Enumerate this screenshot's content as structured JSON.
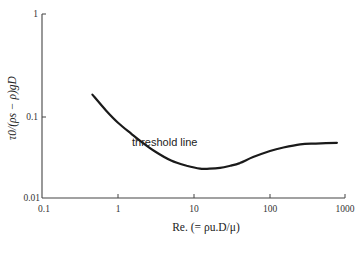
{
  "chart_data": {
    "type": "line",
    "title": "",
    "xlabel": "Re. (= ρu.D/μ)",
    "ylabel": "τ0/(ρs − ρ)gD",
    "xscale": "log",
    "yscale": "log",
    "xlim": [
      0.1,
      1000
    ],
    "ylim": [
      0.01,
      1
    ],
    "xticks": [
      0.1,
      1,
      10,
      100,
      1000
    ],
    "xtick_labels": [
      "0.1",
      "1",
      "10",
      "100",
      "1000"
    ],
    "yticks": [
      0.01,
      0.1,
      1
    ],
    "ytick_labels": [
      "0.01",
      "0.1",
      "1"
    ],
    "grid": false,
    "legend": null,
    "annotations": [
      {
        "text": "threshold line",
        "x": 2.2,
        "y": 0.075
      }
    ],
    "series": [
      {
        "name": "threshold line",
        "x": [
          0.46,
          0.7,
          1.0,
          1.5,
          2,
          3,
          5,
          8,
          12,
          16,
          22,
          30,
          40,
          60,
          100,
          150,
          250,
          400,
          760
        ],
        "values": [
          0.165,
          0.115,
          0.085,
          0.062,
          0.05,
          0.038,
          0.029,
          0.025,
          0.023,
          0.023,
          0.0235,
          0.025,
          0.027,
          0.032,
          0.038,
          0.042,
          0.046,
          0.047,
          0.048
        ]
      }
    ]
  }
}
